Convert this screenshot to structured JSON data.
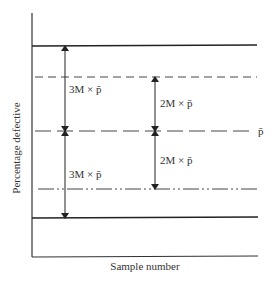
{
  "diagram": {
    "title": "",
    "y_axis_label": "Percentage defective",
    "x_axis_label": "Sample number",
    "center_line_label": "p̄",
    "upper_span_label": "3M × p̄",
    "lower_span_label": "3M × p̄",
    "upper_warning_label": "2M × p̄",
    "lower_warning_label": "2M × p̄",
    "lines": [
      {
        "name": "upper-action-limit",
        "style": "solid",
        "y": 46
      },
      {
        "name": "upper-warning-limit",
        "style": "dashed",
        "y": 77
      },
      {
        "name": "center-line",
        "style": "long-dash",
        "y": 131
      },
      {
        "name": "lower-warning-limit",
        "style": "dash-dot",
        "y": 189
      },
      {
        "name": "lower-action-limit",
        "style": "solid",
        "y": 218
      }
    ],
    "line_color": "#222222"
  }
}
